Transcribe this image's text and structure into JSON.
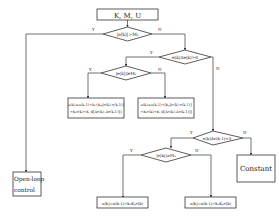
{
  "flowchart": {
    "start": {
      "label": "K, M, U"
    },
    "decisions": {
      "d1": {
        "label": "|e(k)|>M₁"
      },
      "d2": {
        "label": "e(k)Δe(k)>0"
      },
      "d3": {
        "label": "|e(k)|≥M₂"
      },
      "d4": {
        "label": "e(k)Δe(k-1)<0"
      },
      "d5": {
        "label": "|e(k)|≥M₂"
      }
    },
    "processes": {
      "p1": {
        "line1": "u(k)=u(k-1)+k₁{Kₚ[e(k)-e(k-1)]",
        "line2": "+Kᵢe(k)+K_d[Δe(k)-Δe(k-1)]}"
      },
      "p2": {
        "line1": "u(k)=u(k-1)+[Kₚ[e(k)-e(k-1)]",
        "line2": "+Kᵢe(k)+K_d[Δe(k)-Δe(k-1)]]"
      },
      "p3": {
        "label": "u(k)=u(k-1)+k₂Kₚe(k)"
      },
      "p4": {
        "label": "u(k)=u(k-1)+k₃Kₚe(k)"
      }
    },
    "terminals": {
      "open_loop": {
        "line1": "Open-loop",
        "line2": "control"
      },
      "constant": {
        "label": "Constant"
      }
    },
    "edge_labels": {
      "yes": "Y",
      "no": "N"
    },
    "colors": {
      "stroke": "#333333",
      "text": "#222222",
      "background": "#ffffff"
    }
  }
}
